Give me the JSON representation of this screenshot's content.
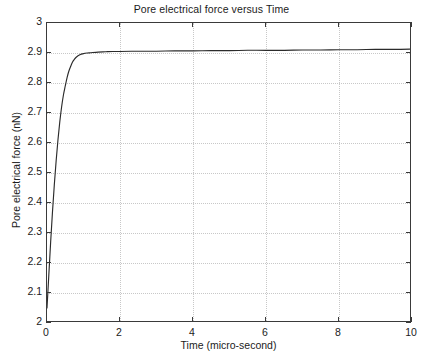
{
  "chart_data": {
    "type": "line",
    "title": "Pore electrical force versus Time",
    "xlabel": "Time  (micro-second)",
    "ylabel": "Pore electrical force  (nN)",
    "xlim": [
      0,
      10
    ],
    "ylim": [
      2,
      3
    ],
    "grid": true,
    "legend": null,
    "x_ticks": [
      "0",
      "2",
      "4",
      "6",
      "8",
      "10"
    ],
    "x_tick_values": [
      0,
      2,
      4,
      6,
      8,
      10
    ],
    "y_ticks": [
      "2",
      "2.1",
      "2.2",
      "2.3",
      "2.4",
      "2.5",
      "2.6",
      "2.7",
      "2.8",
      "2.9",
      "3"
    ],
    "y_tick_values": [
      2,
      2.1,
      2.2,
      2.3,
      2.4,
      2.5,
      2.6,
      2.7,
      2.8,
      2.9,
      3
    ],
    "series": [
      {
        "name": "Pore electrical force",
        "color": "#2b2b2b",
        "x": [
          0,
          0.05,
          0.1,
          0.15,
          0.2,
          0.25,
          0.3,
          0.35,
          0.4,
          0.45,
          0.5,
          0.55,
          0.6,
          0.65,
          0.7,
          0.75,
          0.8,
          0.9,
          1.0,
          1.1,
          1.2,
          1.4,
          1.6,
          1.8,
          2.0,
          2.5,
          3.0,
          3.5,
          4.0,
          4.5,
          5.0,
          5.5,
          6.0,
          6.5,
          7.0,
          7.5,
          8.0,
          8.5,
          9.0,
          9.5,
          10.0
        ],
        "y": [
          2.05,
          2.16,
          2.27,
          2.37,
          2.46,
          2.54,
          2.61,
          2.67,
          2.72,
          2.76,
          2.79,
          2.818,
          2.84,
          2.856,
          2.87,
          2.879,
          2.886,
          2.894,
          2.898,
          2.9,
          2.901,
          2.903,
          2.904,
          2.905,
          2.905,
          2.906,
          2.906,
          2.907,
          2.907,
          2.908,
          2.908,
          2.909,
          2.909,
          2.909,
          2.91,
          2.91,
          2.911,
          2.911,
          2.912,
          2.912,
          2.913
        ]
      }
    ]
  },
  "figure": {
    "background_color": "#ffffff",
    "axis_color": "#3a3a3a",
    "grid_color": "#c8c8c8"
  }
}
